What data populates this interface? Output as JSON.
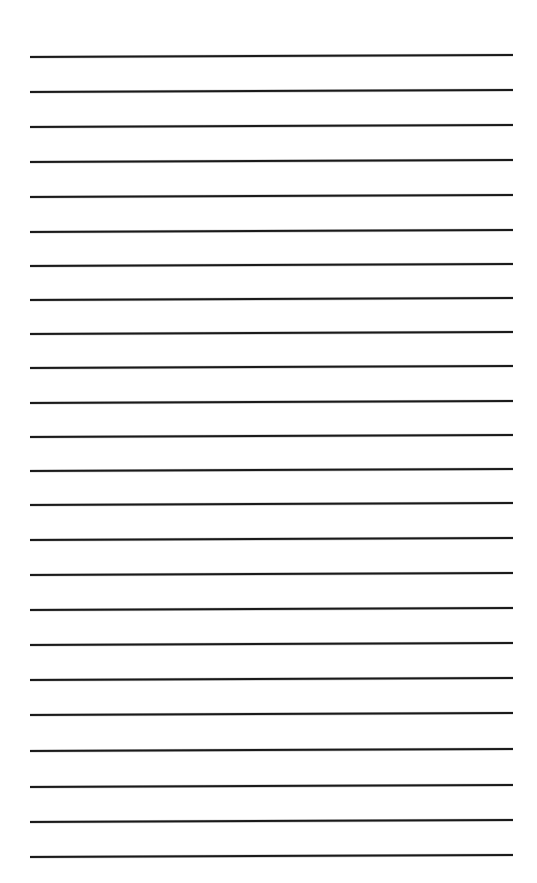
{
  "page": {
    "kind": "ruled-paper-sheet",
    "title": "Blank Ruled Paper",
    "width": 537,
    "height": 883,
    "background_color": "#ffffff",
    "orientation": "portrait"
  },
  "ruling": {
    "line_color": "#1a1a1a",
    "line_thickness": 2.1,
    "line_count": 24,
    "left_margin_x": 30,
    "right_margin_x": 513,
    "line_length": 483,
    "first_line_y": 57,
    "last_line_y": 857,
    "line_spacing": 34.8,
    "tilt_degrees": -0.24,
    "style": "single-ruled-horizontal",
    "has_vertical_margin_rule": false,
    "has_holes": false,
    "lines": [
      {
        "index": 1,
        "y_left": 57,
        "y_right": 55
      },
      {
        "index": 2,
        "y_left": 92,
        "y_right": 90
      },
      {
        "index": 3,
        "y_left": 127,
        "y_right": 125
      },
      {
        "index": 4,
        "y_left": 162,
        "y_right": 160
      },
      {
        "index": 5,
        "y_left": 197,
        "y_right": 195
      },
      {
        "index": 6,
        "y_left": 232,
        "y_right": 230
      },
      {
        "index": 7,
        "y_left": 266,
        "y_right": 264
      },
      {
        "index": 8,
        "y_left": 300,
        "y_right": 298
      },
      {
        "index": 9,
        "y_left": 334,
        "y_right": 332
      },
      {
        "index": 10,
        "y_left": 368,
        "y_right": 366
      },
      {
        "index": 11,
        "y_left": 403,
        "y_right": 401
      },
      {
        "index": 12,
        "y_left": 437,
        "y_right": 435
      },
      {
        "index": 13,
        "y_left": 471,
        "y_right": 469
      },
      {
        "index": 14,
        "y_left": 505,
        "y_right": 503
      },
      {
        "index": 15,
        "y_left": 540,
        "y_right": 538
      },
      {
        "index": 16,
        "y_left": 575,
        "y_right": 573
      },
      {
        "index": 17,
        "y_left": 610,
        "y_right": 608
      },
      {
        "index": 18,
        "y_left": 645,
        "y_right": 643
      },
      {
        "index": 19,
        "y_left": 680,
        "y_right": 678
      },
      {
        "index": 20,
        "y_left": 715,
        "y_right": 713
      },
      {
        "index": 21,
        "y_left": 751,
        "y_right": 749
      },
      {
        "index": 22,
        "y_left": 787,
        "y_right": 785
      },
      {
        "index": 23,
        "y_left": 822,
        "y_right": 820
      },
      {
        "index": 24,
        "y_left": 857,
        "y_right": 855
      }
    ]
  },
  "content": {
    "written_text": "",
    "is_blank": true
  }
}
